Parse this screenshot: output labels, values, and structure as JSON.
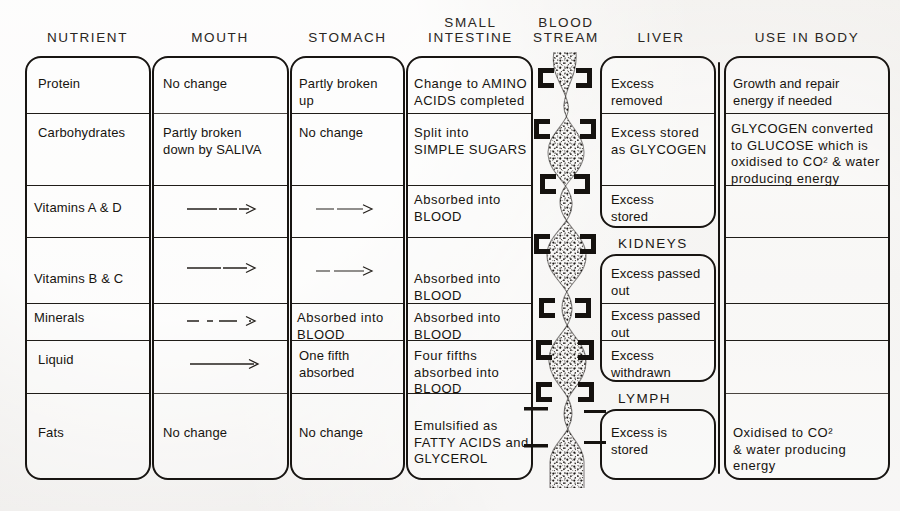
{
  "headers": [
    {
      "label": "NUTRIENT",
      "x": 26,
      "w": 123
    },
    {
      "label": "MOUTH",
      "x": 153,
      "w": 134
    },
    {
      "label": "STOMACH",
      "x": 291,
      "w": 113
    },
    {
      "label": "SMALL\nINTESTINE",
      "x": 408,
      "w": 125
    },
    {
      "label": "BLOOD\nSTREAM",
      "x": 528,
      "w": 80
    },
    {
      "label": "LIVER",
      "x": 606,
      "w": 110
    },
    {
      "label": "USE IN BODY",
      "x": 722,
      "w": 170
    }
  ],
  "organ_labels": [
    {
      "label": "KIDNEYS",
      "x": 618,
      "y": 236
    },
    {
      "label": "LYMPH",
      "x": 618,
      "y": 391
    }
  ],
  "rows": [
    {
      "nutrient": "Protein",
      "mouth": "No change",
      "stomach": "Partly broken\nup",
      "small_intestine": "Change to AMINO\nACIDS completed",
      "liver": "Excess\nremoved",
      "use_in_body": "Growth and repair\nenergy if needed"
    },
    {
      "nutrient": "Carbohydrates",
      "mouth": "Partly broken\ndown by SALIVA",
      "stomach": "No change",
      "small_intestine": "Split into\nSIMPLE SUGARS",
      "liver": "Excess stored\nas GLYCOGEN",
      "use_in_body": "GLYCOGEN converted\nto GLUCOSE which is\noxidised to CO² & water\nproducing energy"
    },
    {
      "nutrient": "Vitamins A & D",
      "mouth": "arrow-long",
      "stomach": "arrow-short",
      "small_intestine": "Absorbed into\nBLOOD",
      "liver": "Excess\nstored",
      "use_in_body": ""
    },
    {
      "nutrient": "Vitamins B & C",
      "mouth": "arrow-long",
      "stomach": "arrow-short",
      "small_intestine": "Absorbed into\nBLOOD",
      "liver": "Excess passed\nout",
      "use_in_body": ""
    },
    {
      "nutrient": "Minerals",
      "mouth": "arrow-dashed",
      "stomach": "Absorbed into\nBLOOD",
      "small_intestine": "Absorbed into\nBLOOD",
      "liver": "Excess passed\nout",
      "use_in_body": ""
    },
    {
      "nutrient": "Liquid",
      "mouth": "arrow-long",
      "stomach": "One fifth\nabsorbed",
      "small_intestine": "Four fifths\nabsorbed into\nBLOOD",
      "liver": "Excess\nwithdrawn",
      "use_in_body": ""
    },
    {
      "nutrient": "Fats",
      "mouth": "No change",
      "stomach": "No change",
      "small_intestine": "Emulsified as\nFATTY ACIDS and\nGLYCEROL",
      "liver": "Excess is\nstored",
      "use_in_body": "Oxidised to CO²\n& water producing\nenergy"
    }
  ],
  "colors": {
    "ink": "#181512",
    "paper": "#eceae7"
  }
}
